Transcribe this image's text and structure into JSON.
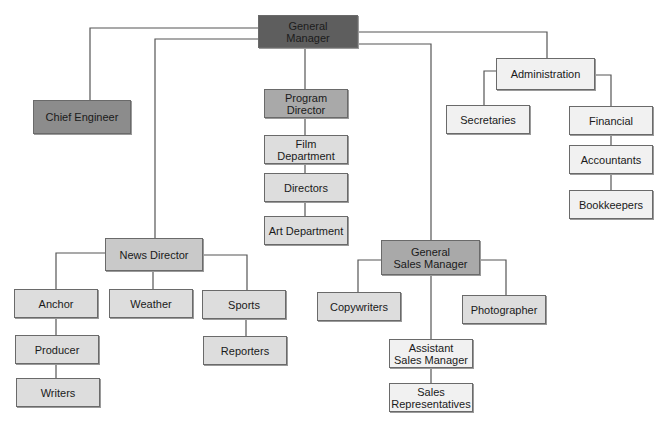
{
  "diagram": {
    "type": "org-chart",
    "nodes": [
      {
        "id": "gm",
        "label": "General\nManager",
        "x": 258,
        "y": 15,
        "w": 100,
        "h": 33,
        "shade": "lvl0"
      },
      {
        "id": "ce",
        "label": "Chief Engineer",
        "x": 33,
        "y": 100,
        "w": 98,
        "h": 34,
        "shade": "lvl1"
      },
      {
        "id": "pd",
        "label": "Program Director",
        "x": 264,
        "y": 89,
        "w": 84,
        "h": 29,
        "shade": "lvl2"
      },
      {
        "id": "film",
        "label": "Film\nDepartment",
        "x": 264,
        "y": 135,
        "w": 84,
        "h": 29,
        "shade": "lvl4"
      },
      {
        "id": "dir",
        "label": "Directors",
        "x": 264,
        "y": 173,
        "w": 84,
        "h": 29,
        "shade": "lvl4"
      },
      {
        "id": "art",
        "label": "Art Department",
        "x": 264,
        "y": 216,
        "w": 84,
        "h": 29,
        "shade": "lvl4"
      },
      {
        "id": "adm",
        "label": "Administration",
        "x": 496,
        "y": 58,
        "w": 99,
        "h": 32,
        "shade": "lvl5"
      },
      {
        "id": "sec",
        "label": "Secretaries",
        "x": 446,
        "y": 105,
        "w": 84,
        "h": 29,
        "shade": "lvl5"
      },
      {
        "id": "fin",
        "label": "Financial",
        "x": 569,
        "y": 106,
        "w": 84,
        "h": 29,
        "shade": "lvl5"
      },
      {
        "id": "acc",
        "label": "Accountants",
        "x": 569,
        "y": 145,
        "w": 84,
        "h": 29,
        "shade": "lvl5"
      },
      {
        "id": "book",
        "label": "Bookkeepers",
        "x": 569,
        "y": 190,
        "w": 84,
        "h": 29,
        "shade": "lvl5"
      },
      {
        "id": "news",
        "label": "News Director",
        "x": 105,
        "y": 238,
        "w": 98,
        "h": 33,
        "shade": "lvl3"
      },
      {
        "id": "anc",
        "label": "Anchor",
        "x": 14,
        "y": 289,
        "w": 84,
        "h": 29,
        "shade": "lvl4"
      },
      {
        "id": "wea",
        "label": "Weather",
        "x": 109,
        "y": 289,
        "w": 84,
        "h": 29,
        "shade": "lvl4"
      },
      {
        "id": "spo",
        "label": "Sports",
        "x": 202,
        "y": 290,
        "w": 84,
        "h": 29,
        "shade": "lvl4"
      },
      {
        "id": "rep",
        "label": "Reporters",
        "x": 203,
        "y": 336,
        "w": 84,
        "h": 29,
        "shade": "lvl4"
      },
      {
        "id": "pro",
        "label": "Producer",
        "x": 15,
        "y": 335,
        "w": 84,
        "h": 29,
        "shade": "lvl4"
      },
      {
        "id": "wri",
        "label": "Writers",
        "x": 16,
        "y": 378,
        "w": 84,
        "h": 29,
        "shade": "lvl4"
      },
      {
        "id": "gsm",
        "label": "General\nSales Manager",
        "x": 381,
        "y": 240,
        "w": 99,
        "h": 35,
        "shade": "lvl2"
      },
      {
        "id": "copy",
        "label": "Copywriters",
        "x": 317,
        "y": 292,
        "w": 84,
        "h": 29,
        "shade": "lvl4"
      },
      {
        "id": "photo",
        "label": "Photographer",
        "x": 462,
        "y": 295,
        "w": 84,
        "h": 29,
        "shade": "lvl4"
      },
      {
        "id": "asm",
        "label": "Assistant\nSales Manager",
        "x": 389,
        "y": 339,
        "w": 84,
        "h": 29,
        "shade": "lvl5"
      },
      {
        "id": "srep",
        "label": "Sales\nRepresentatives",
        "x": 389,
        "y": 383,
        "w": 84,
        "h": 29,
        "shade": "lvl5"
      }
    ],
    "edges": [
      {
        "from": "gm",
        "to": "ce",
        "points": "258,28 90,28 90,100"
      },
      {
        "from": "gm",
        "to": "news",
        "points": "258,39 155,39 155,238"
      },
      {
        "from": "gm",
        "to": "pd",
        "points": "305,48 305,89"
      },
      {
        "from": "gm",
        "to": "gsm",
        "points": "358,44 431,44 431,240"
      },
      {
        "from": "gm",
        "to": "adm",
        "points": "358,32 547,32 547,58"
      },
      {
        "from": "pd",
        "to": "film",
        "points": "305,118 305,135"
      },
      {
        "from": "film",
        "to": "dir",
        "points": "305,164 305,173"
      },
      {
        "from": "dir",
        "to": "art",
        "points": "305,202 305,216"
      },
      {
        "from": "adm",
        "to": "sec",
        "points": "496,71 484,71 484,105"
      },
      {
        "from": "adm",
        "to": "fin",
        "points": "595,75 611,75 611,106"
      },
      {
        "from": "fin",
        "to": "acc",
        "points": "611,135 611,145"
      },
      {
        "from": "acc",
        "to": "book",
        "points": "611,174 611,190"
      },
      {
        "from": "news",
        "to": "anc",
        "points": "105,253 56,253 56,289"
      },
      {
        "from": "news",
        "to": "wea",
        "points": "153,271 153,289"
      },
      {
        "from": "news",
        "to": "spo",
        "points": "203,255 247,255 247,290"
      },
      {
        "from": "anc",
        "to": "pro",
        "points": "56,318 56,335"
      },
      {
        "from": "pro",
        "to": "wri",
        "points": "56,364 56,378"
      },
      {
        "from": "spo",
        "to": "rep",
        "points": "246,319 246,336"
      },
      {
        "from": "gsm",
        "to": "copy",
        "points": "381,260 358,260 358,292"
      },
      {
        "from": "gsm",
        "to": "photo",
        "points": "480,260 506,260 506,295"
      },
      {
        "from": "gsm",
        "to": "asm",
        "points": "431,275 431,339"
      },
      {
        "from": "asm",
        "to": "srep",
        "points": "431,368 431,383"
      }
    ]
  }
}
